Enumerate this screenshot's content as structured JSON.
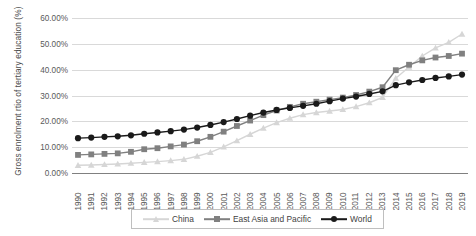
{
  "chart_data": {
    "type": "line",
    "title": "",
    "xlabel": "",
    "ylabel": "Gross enrolment rtio of tertiary education (%)",
    "ylim": [
      0,
      60
    ],
    "ytick_labels": [
      "0.00%",
      "10.00%",
      "20.00%",
      "30.00%",
      "40.00%",
      "50.00%",
      "60.00%"
    ],
    "ytick_values": [
      0,
      10,
      20,
      30,
      40,
      50,
      60
    ],
    "grid": "horizontal",
    "legend_position": "bottom",
    "categories": [
      "1990",
      "1991",
      "1992",
      "1993",
      "1994",
      "1995",
      "1996",
      "1997",
      "1998",
      "1999",
      "2000",
      "2001",
      "2002",
      "2003",
      "2004",
      "2005",
      "2006",
      "2007",
      "2008",
      "2009",
      "2010",
      "2011",
      "2012",
      "2013",
      "2014",
      "2015",
      "2016",
      "2017",
      "2018",
      "2019"
    ],
    "series": [
      {
        "name": "China",
        "color": "#d6d6d6",
        "marker": "triangle",
        "values": [
          3.0,
          3.1,
          3.3,
          3.5,
          3.8,
          4.1,
          4.4,
          4.8,
          5.3,
          6.5,
          8.0,
          10.1,
          12.5,
          15.0,
          17.4,
          19.5,
          21.2,
          22.6,
          23.4,
          24.0,
          24.6,
          25.7,
          27.2,
          29.3,
          36.7,
          41.0,
          45.3,
          48.4,
          50.6,
          53.8
        ]
      },
      {
        "name": "East Asia and Pacific",
        "color": "#808080",
        "marker": "square",
        "values": [
          7.0,
          7.2,
          7.4,
          7.6,
          8.2,
          9.2,
          9.6,
          10.3,
          11.0,
          12.3,
          14.0,
          16.0,
          18.2,
          20.3,
          22.4,
          24.2,
          25.6,
          26.8,
          27.6,
          28.4,
          29.2,
          30.2,
          31.5,
          33.2,
          39.8,
          41.9,
          43.6,
          44.7,
          45.3,
          46.2
        ]
      },
      {
        "name": "World",
        "color": "#1a1a1a",
        "marker": "circle",
        "values": [
          13.5,
          13.7,
          14.0,
          14.2,
          14.6,
          15.2,
          15.7,
          16.2,
          16.8,
          17.6,
          18.6,
          19.7,
          20.9,
          22.2,
          23.4,
          24.4,
          25.2,
          26.0,
          26.8,
          27.8,
          28.8,
          29.6,
          30.6,
          31.6,
          34.0,
          35.1,
          36.0,
          36.8,
          37.4,
          38.1
        ]
      }
    ]
  },
  "legend": {
    "items": [
      {
        "label": "China",
        "color": "#d6d6d6",
        "marker": "triangle"
      },
      {
        "label": "East Asia and Pacific",
        "color": "#808080",
        "marker": "square"
      },
      {
        "label": "World",
        "color": "#1a1a1a",
        "marker": "circle"
      }
    ]
  }
}
